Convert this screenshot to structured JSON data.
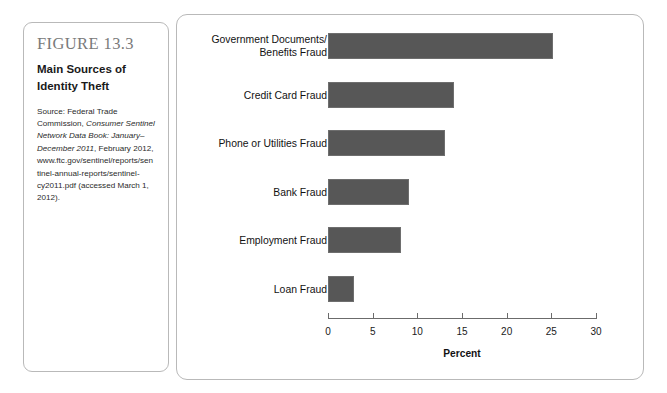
{
  "figure": {
    "number": "FIGURE 13.3",
    "title": "Main Sources of Identity Theft",
    "source_prefix": "Source: Federal Trade Commission, ",
    "source_italic": "Consumer Sentinel Network Data Book: January–December 2011",
    "source_suffix": ", February 2012, www.ftc.gov/sentinel/reports/sentinel-annual-reports/sentinel-cy2011.pdf (accessed March 1, 2012)."
  },
  "chart_data": {
    "type": "bar",
    "orientation": "horizontal",
    "title": "Main Sources of Identity Theft",
    "xlabel": "Percent",
    "ylabel": "",
    "xlim": [
      0,
      30
    ],
    "ticks": [
      0,
      5,
      10,
      15,
      20,
      25,
      30
    ],
    "tick_labels": [
      "0",
      "5",
      "10",
      "15",
      "20",
      "25",
      "30"
    ],
    "grid": false,
    "legend": "none",
    "bar_color": "#575757",
    "categories": [
      "Government Documents/\nBenefits Fraud",
      "Credit Card Fraud",
      "Phone or Utilities Fraud",
      "Bank Fraud",
      "Employment Fraud",
      "Loan Fraud"
    ],
    "values": [
      25.2,
      14.1,
      13.1,
      9.1,
      8.2,
      2.9
    ]
  }
}
